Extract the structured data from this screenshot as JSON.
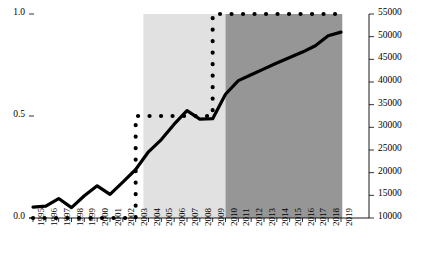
{
  "chart_data": {
    "type": "line",
    "title": "",
    "xlabel": "",
    "ylabel": "",
    "grid": false,
    "legend": "none",
    "x": [
      1995,
      1996,
      1997,
      1998,
      1999,
      2000,
      2001,
      2002,
      2003,
      2004,
      2005,
      2006,
      2007,
      2008,
      2009,
      2010,
      2011,
      2012,
      2013,
      2014,
      2015,
      2016,
      2017,
      2018,
      2019
    ],
    "xtick_labels": [
      "1995",
      "1996",
      "1997",
      "1998",
      "1999",
      "2000",
      "2001",
      "2002",
      "2003",
      "2004",
      "2005",
      "2006",
      "2007",
      "2008",
      "2009",
      "2010",
      "2011",
      "2012",
      "2013",
      "2014",
      "2015",
      "2016",
      "2017",
      "2018",
      "2019"
    ],
    "left_axis": {
      "ticks": [
        0.0,
        0.5,
        1.0
      ],
      "tick_labels": [
        "0.0",
        "0.5",
        "1.0"
      ],
      "ylim": [
        0.0,
        1.0
      ]
    },
    "right_axis": {
      "ticks": [
        10000,
        15000,
        20000,
        25000,
        30000,
        35000,
        40000,
        45000,
        50000,
        55000
      ],
      "tick_labels": [
        "10000",
        "15000",
        "20000",
        "25000",
        "30000",
        "35000",
        "40000",
        "45000",
        "50000",
        "55000"
      ],
      "ylim": [
        10000,
        55000
      ]
    },
    "series": [
      {
        "name": "step-dotted-series",
        "style": "dotted",
        "axis": "left",
        "color": "#000000",
        "values": [
          0.0,
          0.0,
          0.0,
          0.0,
          0.0,
          0.0,
          0.0,
          0.0,
          0.0,
          0.5,
          0.5,
          0.5,
          0.5,
          0.5,
          0.5,
          1.0,
          1.0,
          1.0,
          1.0,
          1.0,
          1.0,
          1.0,
          1.0,
          1.0,
          1.0
        ]
      },
      {
        "name": "solid-trend-series",
        "style": "solid",
        "axis": "right",
        "color": "#000000",
        "values": [
          12400,
          12600,
          14300,
          12300,
          14900,
          17100,
          15200,
          17900,
          20700,
          24600,
          27300,
          30700,
          33700,
          31800,
          31900,
          37300,
          40300,
          41600,
          42900,
          44200,
          45400,
          46600,
          48000,
          50200,
          51000
        ]
      }
    ],
    "shaded_regions": [
      {
        "name": "light-band",
        "from": 2003.6,
        "to": 2010.0,
        "color": "#e1e1e1"
      },
      {
        "name": "dark-band",
        "from": 2010.0,
        "to": 2019.1,
        "color": "#969696"
      }
    ]
  }
}
